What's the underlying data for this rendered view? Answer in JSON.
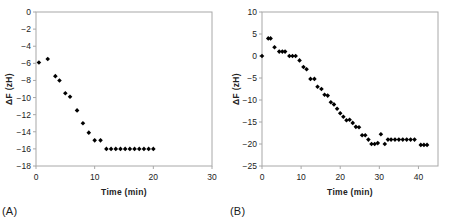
{
  "figure": {
    "panel_a_tag": "(A)",
    "panel_b_tag": "(B)"
  },
  "chart_data": [
    {
      "id": "panel-a",
      "type": "scatter",
      "title": "",
      "panel_label": "(A)",
      "xlabel": "Time  (min)",
      "ylabel": "ΔF (zH)",
      "xlim": [
        0,
        30
      ],
      "ylim": [
        -18,
        0
      ],
      "xticks": [
        0,
        10,
        20,
        30
      ],
      "yticks": [
        0,
        -2,
        -4,
        -6,
        -8,
        -10,
        -12,
        -14,
        -16,
        -18
      ],
      "xticklabels": [
        "0",
        "10",
        "20",
        "30"
      ],
      "yticklabels": [
        "0",
        "−2",
        "−4",
        "−6",
        "−8",
        "−10",
        "−12",
        "−14",
        "−16",
        "−18"
      ],
      "grid": false,
      "legend": null,
      "marker": "diamond",
      "marker_color": "#000000",
      "x": [
        0.5,
        2.0,
        3.3,
        4.0,
        5.0,
        5.8,
        7.0,
        8.0,
        9.0,
        10.0,
        11.0,
        12.0,
        12.8,
        13.6,
        14.4,
        15.2,
        16.0,
        16.8,
        17.6,
        18.4,
        19.2,
        20.0
      ],
      "y": [
        -5.9,
        -5.5,
        -7.5,
        -8.0,
        -9.5,
        -9.9,
        -11.5,
        -13.0,
        -14.1,
        -15.0,
        -15.0,
        -16.0,
        -16.0,
        -16.0,
        -16.0,
        -16.0,
        -16.0,
        -16.0,
        -16.0,
        -16.0,
        -16.0,
        -16.0
      ]
    },
    {
      "id": "panel-b",
      "type": "scatter",
      "title": "",
      "panel_label": "(B)",
      "xlabel": "Time  (min)",
      "ylabel": "ΔF (zH)",
      "xlim": [
        0,
        45
      ],
      "ylim": [
        -25,
        10
      ],
      "xticks": [
        0,
        10,
        20,
        30,
        40
      ],
      "yticks": [
        10,
        5,
        0,
        -5,
        -10,
        -15,
        -20,
        -25
      ],
      "xticklabels": [
        "0",
        "10",
        "20",
        "30",
        "40"
      ],
      "yticklabels": [
        "10",
        "5",
        "0",
        "−5",
        "−10",
        "−15",
        "−20",
        "−25"
      ],
      "grid": false,
      "legend": null,
      "marker": "diamond",
      "marker_color": "#000000",
      "x": [
        0.0,
        1.6,
        2.2,
        3.2,
        4.4,
        5.2,
        5.9,
        7.0,
        7.8,
        8.6,
        9.6,
        10.6,
        11.4,
        12.4,
        13.4,
        14.2,
        15.2,
        16.0,
        16.8,
        17.6,
        18.4,
        19.2,
        20.0,
        20.8,
        21.6,
        22.4,
        23.2,
        24.0,
        24.8,
        25.6,
        26.4,
        27.2,
        28.0,
        28.8,
        29.6,
        30.4,
        31.4,
        32.2,
        33.0,
        34.0,
        35.0,
        36.0,
        37.0,
        38.0,
        39.0,
        40.6,
        41.4,
        42.2
      ],
      "y": [
        0.0,
        4.0,
        4.0,
        2.0,
        1.0,
        1.0,
        1.0,
        0.0,
        0.0,
        0.0,
        -1.0,
        -2.5,
        -3.0,
        -5.2,
        -5.2,
        -7.0,
        -7.5,
        -8.8,
        -9.0,
        -10.5,
        -11.0,
        -12.0,
        -13.0,
        -13.8,
        -14.6,
        -14.5,
        -15.2,
        -16.1,
        -16.2,
        -18.0,
        -18.0,
        -19.0,
        -20.0,
        -20.0,
        -19.8,
        -17.8,
        -20.0,
        -19.0,
        -19.0,
        -19.0,
        -19.0,
        -19.0,
        -19.0,
        -19.0,
        -19.0,
        -20.2,
        -20.2,
        -20.2
      ]
    }
  ]
}
